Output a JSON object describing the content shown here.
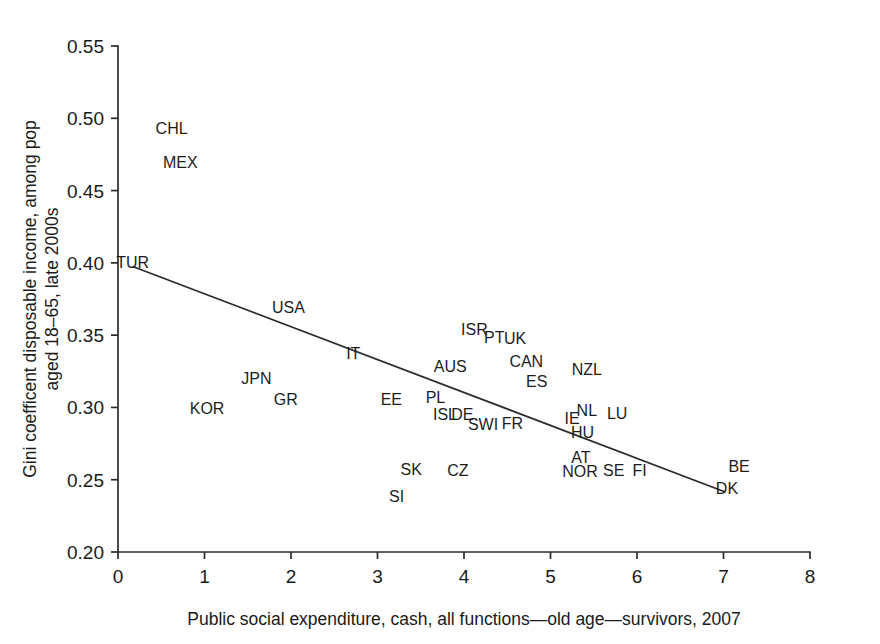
{
  "chart_data": {
    "type": "scatter",
    "title": "",
    "xlabel": "Public social expenditure, cash, all functions—old age—survivors, 2007",
    "ylabel_line1": "Gini coefficent disposable income, among pop",
    "ylabel_line2": "aged 18–65, late 2000s",
    "xlim": [
      0,
      8
    ],
    "ylim": [
      0.2,
      0.55
    ],
    "xticks": [
      "0",
      "1",
      "2",
      "3",
      "4",
      "5",
      "6",
      "7",
      "8"
    ],
    "xtick_values": [
      0,
      1,
      2,
      3,
      4,
      5,
      6,
      7,
      8
    ],
    "yticks": [
      "0.20",
      "0.25",
      "0.30",
      "0.35",
      "0.40",
      "0.45",
      "0.50",
      "0.55"
    ],
    "ytick_values": [
      0.2,
      0.25,
      0.3,
      0.35,
      0.4,
      0.45,
      0.5,
      0.55
    ],
    "grid": false,
    "legend": "none",
    "marker_style": "text-labels-only",
    "trendline": {
      "label": "linear fit",
      "x_start": 0.17,
      "y_start": 0.3975,
      "x_end": 7.02,
      "y_end": 0.2415
    },
    "points": [
      {
        "label": "CHL",
        "x": 0.62,
        "y": 0.4935
      },
      {
        "label": "MEX",
        "x": 0.72,
        "y": 0.4695
      },
      {
        "label": "TUR",
        "x": 0.17,
        "y": 0.4005
      },
      {
        "label": "USA",
        "x": 1.97,
        "y": 0.3695
      },
      {
        "label": "ISR",
        "x": 4.12,
        "y": 0.3545
      },
      {
        "label": "PT",
        "x": 4.35,
        "y": 0.349
      },
      {
        "label": "UK",
        "x": 4.59,
        "y": 0.348
      },
      {
        "label": "IT",
        "x": 2.72,
        "y": 0.3375
      },
      {
        "label": "CAN",
        "x": 4.72,
        "y": 0.332
      },
      {
        "label": "AUS",
        "x": 3.84,
        "y": 0.329
      },
      {
        "label": "NZL",
        "x": 5.42,
        "y": 0.3265
      },
      {
        "label": "JPN",
        "x": 1.6,
        "y": 0.3205
      },
      {
        "label": "ES",
        "x": 4.84,
        "y": 0.3185
      },
      {
        "label": "GR",
        "x": 1.94,
        "y": 0.3055
      },
      {
        "label": "EE",
        "x": 3.16,
        "y": 0.3055
      },
      {
        "label": "PL",
        "x": 3.67,
        "y": 0.307
      },
      {
        "label": "KOR",
        "x": 1.03,
        "y": 0.2995
      },
      {
        "label": "NL",
        "x": 5.42,
        "y": 0.2985
      },
      {
        "label": "LU",
        "x": 5.77,
        "y": 0.296
      },
      {
        "label": "ISL",
        "x": 3.78,
        "y": 0.2955
      },
      {
        "label": "DE",
        "x": 3.98,
        "y": 0.2955
      },
      {
        "label": "IE",
        "x": 5.25,
        "y": 0.293
      },
      {
        "label": "SWI",
        "x": 4.22,
        "y": 0.2885
      },
      {
        "label": "FR",
        "x": 4.56,
        "y": 0.289
      },
      {
        "label": "HU",
        "x": 5.37,
        "y": 0.283
      },
      {
        "label": "AT",
        "x": 5.35,
        "y": 0.2655
      },
      {
        "label": "BE",
        "x": 7.18,
        "y": 0.2595
      },
      {
        "label": "SE",
        "x": 5.73,
        "y": 0.257
      },
      {
        "label": "FI",
        "x": 6.03,
        "y": 0.257
      },
      {
        "label": "NOR",
        "x": 5.34,
        "y": 0.256
      },
      {
        "label": "SK",
        "x": 3.39,
        "y": 0.2575
      },
      {
        "label": "CZ",
        "x": 3.93,
        "y": 0.2565
      },
      {
        "label": "DK",
        "x": 7.04,
        "y": 0.244
      },
      {
        "label": "SI",
        "x": 3.22,
        "y": 0.2385
      }
    ]
  }
}
